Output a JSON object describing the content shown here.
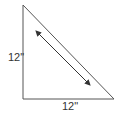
{
  "diagram": {
    "type": "right-triangle",
    "stroke_color": "#555555",
    "vertices": {
      "top": [
        23,
        5
      ],
      "right_angle": [
        23,
        99
      ],
      "right": [
        114,
        99
      ]
    },
    "labels": {
      "left_side": "12\"",
      "bottom_side": "12\""
    },
    "arrow": {
      "from": [
        36,
        31
      ],
      "to": [
        90,
        85
      ],
      "style": "double-headed"
    }
  }
}
